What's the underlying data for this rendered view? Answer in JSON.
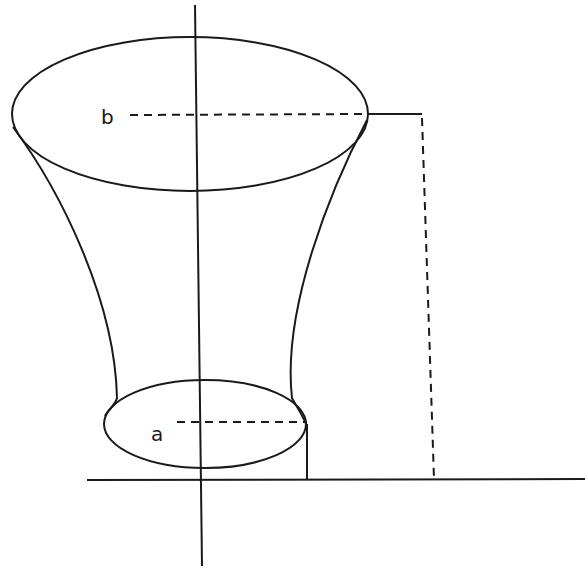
{
  "diagram": {
    "type": "solid-of-revolution",
    "labels": {
      "top_radius": "b",
      "bottom_radius": "a"
    },
    "stroke_color": "#1a1a1a",
    "background": "#ffffff"
  }
}
